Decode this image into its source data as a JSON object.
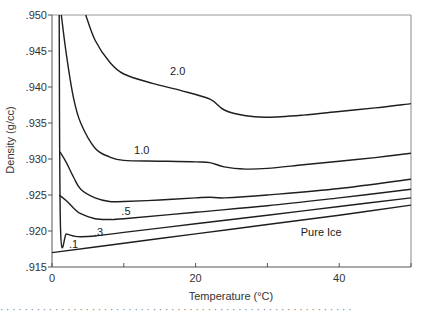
{
  "chart_data": {
    "type": "line",
    "title": "",
    "xlabel": "Temperature (°C)",
    "ylabel": "Density (g/cc)",
    "xlim": [
      0,
      50
    ],
    "ylim": [
      0.915,
      0.95
    ],
    "grid": false,
    "legend": "inline curve labels",
    "x_ticks": [
      0,
      10,
      20,
      30,
      40,
      50
    ],
    "x_tick_labels": [
      "0",
      "",
      "20",
      "",
      "40",
      ""
    ],
    "y_ticks": [
      0.915,
      0.92,
      0.925,
      0.93,
      0.935,
      0.94,
      0.945,
      0.95
    ],
    "y_tick_labels": [
      ".915",
      ".920",
      ".925",
      ".930",
      ".935",
      ".940",
      ".945",
      ".950"
    ],
    "series": [
      {
        "name": "2.0",
        "label_pos": [
          17.5,
          0.9416
        ],
        "x": [
          4.7,
          6,
          8,
          10,
          14,
          18,
          22,
          24,
          27,
          30,
          35,
          40,
          45,
          50
        ],
        "y": [
          0.95,
          0.9465,
          0.9435,
          0.9418,
          0.9405,
          0.9395,
          0.9383,
          0.9368,
          0.936,
          0.9358,
          0.9361,
          0.9366,
          0.9371,
          0.9377
        ]
      },
      {
        "name": "1.0",
        "label_pos": [
          12.5,
          0.9307
        ],
        "x": [
          1.3,
          2,
          3,
          4,
          6,
          8,
          10,
          15,
          20,
          22,
          24,
          27,
          30,
          35,
          40,
          45,
          50
        ],
        "y": [
          0.95,
          0.9445,
          0.9385,
          0.935,
          0.9315,
          0.9303,
          0.9298,
          0.9297,
          0.9296,
          0.9295,
          0.9289,
          0.9286,
          0.9287,
          0.9292,
          0.9297,
          0.9302,
          0.9308
        ]
      },
      {
        "name": ".5",
        "label_pos": [
          10.3,
          0.9222
        ],
        "x": [
          1.1,
          2,
          3,
          4,
          6,
          8,
          10,
          15,
          20,
          22,
          24,
          30,
          40,
          50
        ],
        "y": [
          0.931,
          0.9295,
          0.9275,
          0.9258,
          0.9246,
          0.9241,
          0.9241,
          0.9243,
          0.9246,
          0.9247,
          0.9246,
          0.925,
          0.9259,
          0.9272
        ]
      },
      {
        "name": ".3",
        "label_pos": [
          6.5,
          0.9193
        ],
        "x": [
          1.0,
          2,
          3,
          4,
          6,
          8,
          10,
          20,
          30,
          40,
          50
        ],
        "y": [
          0.925,
          0.9242,
          0.9232,
          0.9224,
          0.9217,
          0.9216,
          0.9217,
          0.9226,
          0.9235,
          0.9246,
          0.9258
        ]
      },
      {
        "name": ".1",
        "label_pos": [
          3.0,
          0.9177
        ],
        "x": [
          1.0,
          1.2,
          2,
          3,
          4,
          6,
          10,
          20,
          30,
          40,
          50
        ],
        "y": [
          0.95,
          0.92,
          0.9196,
          0.9193,
          0.9192,
          0.9193,
          0.9198,
          0.921,
          0.9222,
          0.9234,
          0.9246
        ]
      },
      {
        "name": "Pure Ice",
        "label_pos": [
          37.5,
          0.9193
        ],
        "x": [
          0,
          10,
          20,
          30,
          40,
          50
        ],
        "y": [
          0.917,
          0.9183,
          0.9196,
          0.9209,
          0.9222,
          0.9236
        ]
      }
    ],
    "annotations": [
      "2.0",
      "1.0",
      ".5",
      ".3",
      ".1",
      "Pure Ice"
    ]
  },
  "labels": {
    "xlabel": "Temperature  (°C)",
    "ylabel": "Density  (g/cc)",
    "caption_fragment": "· · · ·  ·  · ·  ·  · · · · ·  · ·  ·  ·  ·  · ·  ·  ·   ·  · · · · ·  · ·  · · · ·  · · · ·  · · ·  · ·  · ·  ·  ·  · · · ·  · · · ·  ·  · ·"
  }
}
